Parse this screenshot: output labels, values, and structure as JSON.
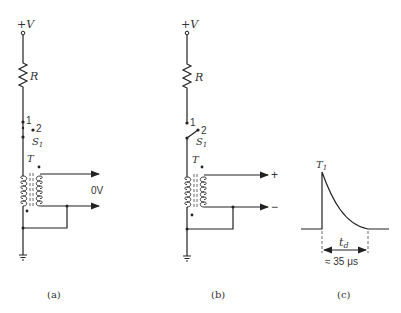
{
  "figure": {
    "panels": [
      {
        "id": "a",
        "caption": "(a)",
        "supply_label": "+V",
        "resistor_label": "R",
        "switch": {
          "label": "S",
          "subscript": "1",
          "position_1_label": "1",
          "position_2_label": "2",
          "state": "position 1"
        },
        "transformer_label": "T",
        "output_label": "0V"
      },
      {
        "id": "b",
        "caption": "(b)",
        "supply_label": "+V",
        "resistor_label": "R",
        "switch": {
          "label": "S",
          "subscript": "1",
          "position_1_label": "1",
          "position_2_label": "2",
          "state": "position 2"
        },
        "transformer_label": "T",
        "output_plus_label": "+",
        "output_minus_label": "−"
      },
      {
        "id": "c",
        "caption": "(c)",
        "pulse_peak_label": "T",
        "pulse_peak_subscript": "1",
        "duration_label": "t",
        "duration_subscript": "d",
        "duration_value": "≈ 35 μs"
      }
    ]
  },
  "colors": {
    "ink": "#222222",
    "background": "#ffffff"
  }
}
